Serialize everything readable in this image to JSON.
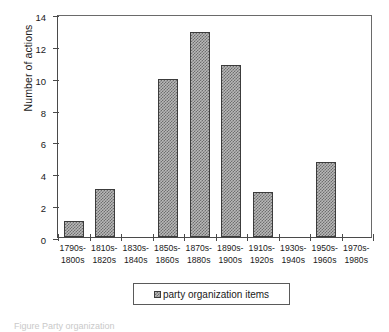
{
  "chart_data": {
    "type": "bar",
    "title": "",
    "xlabel": "",
    "ylabel": "Number of actions",
    "ylim": [
      0,
      14
    ],
    "ytick_values": [
      0,
      2,
      4,
      6,
      8,
      10,
      12,
      14
    ],
    "ytick_labels": [
      "0",
      "2",
      "4",
      "6",
      "8",
      "10",
      "12",
      "14"
    ],
    "grid": false,
    "legend_position": "bottom-center",
    "categories": [
      "1790s-\n1800s",
      "1810s-\n1820s",
      "1830s-\n1840s",
      "1850s-\n1860s",
      "1870s-\n1880s",
      "1890s-\n1900s",
      "1910s-\n1920s",
      "1930s-\n1940s",
      "1950s-\n1960s",
      "1970s-\n1980s"
    ],
    "category_lines": [
      [
        "1790s-",
        "1800s"
      ],
      [
        "1810s-",
        "1820s"
      ],
      [
        "1830s-",
        "1840s"
      ],
      [
        "1850s-",
        "1860s"
      ],
      [
        "1870s-",
        "1880s"
      ],
      [
        "1890s-",
        "1900s"
      ],
      [
        "1910s-",
        "1920s"
      ],
      [
        "1930s-",
        "1940s"
      ],
      [
        "1950s-",
        "1960s"
      ],
      [
        "1970s-",
        "1980s"
      ]
    ],
    "series": [
      {
        "name": "party organization items",
        "values": [
          1,
          3,
          0,
          9.9,
          12.9,
          10.8,
          2.8,
          0,
          4.7,
          0
        ]
      }
    ]
  },
  "legend": {
    "entries": [
      {
        "label": "party organization items",
        "swatch": "hatched-gray-swatch"
      }
    ]
  },
  "caption": {
    "text": "Figure     Party organization"
  },
  "colors": {
    "axis": "#4a4a4a",
    "bar_fill": "#b8b8b8",
    "bar_hatch": "#6e6e6e",
    "bar_edge": "#3c3c3c",
    "text": "#1a1a1a",
    "background": "#ffffff"
  }
}
